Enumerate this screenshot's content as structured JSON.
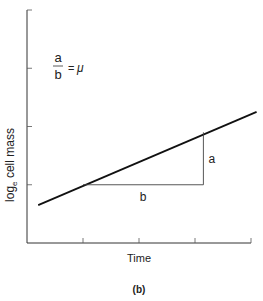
{
  "chart_data": {
    "type": "line",
    "title": "",
    "xlabel": "Time",
    "ylabel": "logₑ cell mass",
    "ylabel_base": "log",
    "ylabel_sub": "e",
    "ylabel_rest": " cell mass",
    "panel_label": "(b)",
    "xlim": [
      0,
      4
    ],
    "ylim": [
      0,
      4
    ],
    "xticks": [
      1,
      2,
      3,
      4
    ],
    "yticks": [
      1,
      2,
      3,
      4
    ],
    "tick_labels_shown": false,
    "grid": false,
    "series": [
      {
        "name": "growth line",
        "x": [
          0.2,
          4.1
        ],
        "y": [
          0.65,
          2.25
        ]
      }
    ],
    "annotations": {
      "triangle": {
        "x0": 1.0,
        "x1": 3.15,
        "y0": 1.0,
        "y1": 1.9
      },
      "rise_label": "a",
      "run_label": "b",
      "formula": {
        "numerator": "a",
        "denominator": "b",
        "equals": "=",
        "result": "μ"
      }
    }
  }
}
